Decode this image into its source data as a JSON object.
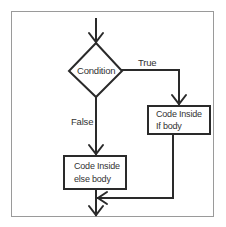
{
  "diagram": {
    "type": "flowchart",
    "colors": {
      "stroke": "#2a2a2a",
      "frame": "#9a9a9a",
      "text": "#333333",
      "background": "#ffffff"
    },
    "nodes": {
      "condition": {
        "shape": "diamond",
        "label": "Condition"
      },
      "if_body": {
        "shape": "rectangle",
        "line1": "Code Inside",
        "line2": "If body"
      },
      "else_body": {
        "shape": "rectangle",
        "line1": "Code Inside",
        "line2": "else body"
      }
    },
    "edges": {
      "true_label": "True",
      "false_label": "False"
    },
    "connections": [
      {
        "from": "entry",
        "to": "condition"
      },
      {
        "from": "condition",
        "to": "if_body",
        "label": "True"
      },
      {
        "from": "condition",
        "to": "else_body",
        "label": "False"
      },
      {
        "from": "if_body",
        "to": "merge"
      },
      {
        "from": "else_body",
        "to": "exit"
      }
    ]
  }
}
